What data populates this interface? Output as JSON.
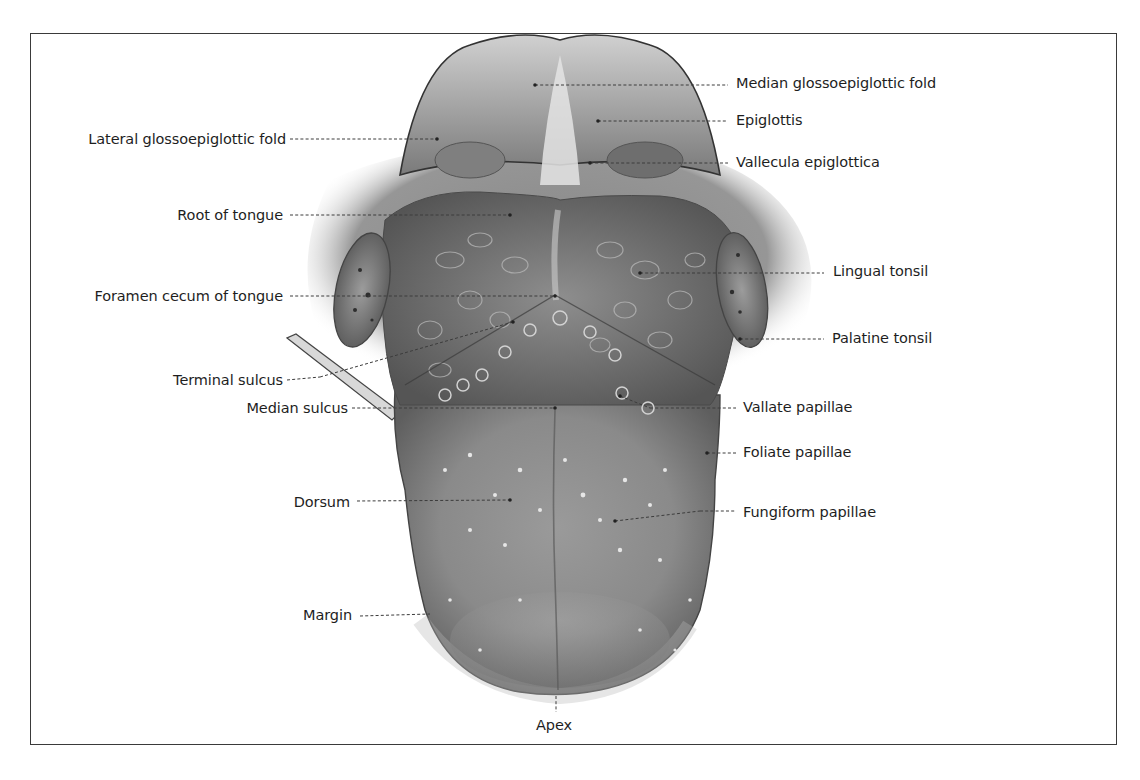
{
  "figure": {
    "colors": {
      "frame": "#3a3a3a",
      "text": "#1e1e1e",
      "tissue_dark": "#5a5a5a",
      "tissue_mid": "#8c8c8c",
      "tissue_light": "#c8c8c8",
      "background": "#ffffff"
    },
    "labels_left": [
      {
        "id": "lateral-glossoepiglottic-fold",
        "text": "Lateral glossoepiglottic fold"
      },
      {
        "id": "root-of-tongue",
        "text": "Root of tongue"
      },
      {
        "id": "foramen-cecum",
        "text": "Foramen cecum of tongue"
      },
      {
        "id": "terminal-sulcus",
        "text": "Terminal sulcus"
      },
      {
        "id": "median-sulcus",
        "text": "Median sulcus"
      },
      {
        "id": "dorsum",
        "text": "Dorsum"
      },
      {
        "id": "margin",
        "text": "Margin"
      }
    ],
    "labels_right": [
      {
        "id": "median-glossoepiglottic-fold",
        "text": "Median glossoepiglottic fold"
      },
      {
        "id": "epiglottis",
        "text": "Epiglottis"
      },
      {
        "id": "vallecula-epiglottica",
        "text": "Vallecula epiglottica"
      },
      {
        "id": "lingual-tonsil",
        "text": "Lingual tonsil"
      },
      {
        "id": "palatine-tonsil",
        "text": "Palatine tonsil"
      },
      {
        "id": "vallate-papillae",
        "text": "Vallate papillae"
      },
      {
        "id": "foliate-papillae",
        "text": "Foliate papillae"
      },
      {
        "id": "fungiform-papillae",
        "text": "Fungiform papillae"
      }
    ],
    "labels_bottom": [
      {
        "id": "apex",
        "text": "Apex"
      }
    ]
  }
}
